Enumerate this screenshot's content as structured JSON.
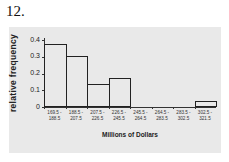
{
  "question_number": "12.",
  "chart_data": {
    "type": "bar",
    "title": "",
    "xlabel": "Millions of Dollars",
    "ylabel": "relative frequency",
    "categories": [
      "169.5 - 188.5",
      "188.5 - 207.5",
      "207.5 - 226.5",
      "226.5 - 245.5",
      "245.5 - 264.5",
      "264.5 - 283.5",
      "283.5 - 302.5",
      "302.5 - 321.5"
    ],
    "category_lines": [
      [
        "169.5 -",
        "188.5"
      ],
      [
        "188.5 -",
        "207.5"
      ],
      [
        "207.5 -",
        "226.5"
      ],
      [
        "226.5 -",
        "245.5"
      ],
      [
        "245.5 -",
        "264.5"
      ],
      [
        "264.5 -",
        "283.5"
      ],
      [
        "283.5 -",
        "302.5"
      ],
      [
        "302.5 -",
        "321.5"
      ]
    ],
    "values": [
      0.37,
      0.3,
      0.13,
      0.17,
      0,
      0,
      0,
      0.03
    ],
    "yticks": [
      "0",
      "0.1",
      "0.2",
      "0.3",
      "0.4"
    ],
    "ylim": [
      0,
      0.4
    ],
    "grid": false,
    "legend": null,
    "histogram": true
  }
}
